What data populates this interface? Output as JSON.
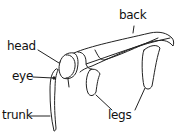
{
  "diagram": {
    "labels": {
      "back": "back",
      "head": "head",
      "eye": "eye",
      "trunk": "trunk",
      "legs": "legs"
    }
  }
}
